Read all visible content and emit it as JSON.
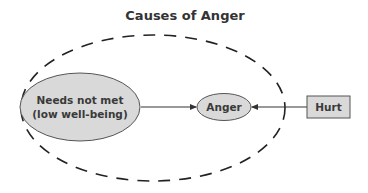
{
  "title": "Causes of Anger",
  "nodes": {
    "needs": {
      "line1": "Needs not met",
      "line2": "(low well-being)"
    },
    "anger": {
      "label": "Anger"
    },
    "hurt": {
      "label": "Hurt"
    }
  },
  "edges": [
    {
      "from": "Needs not met (low well-being)",
      "to": "Anger"
    },
    {
      "from": "Hurt",
      "to": "Anger"
    }
  ],
  "colors": {
    "node_fill": "#d9d9d9",
    "stroke": "#555555",
    "dashed_boundary": "#222222",
    "text": "#333333"
  }
}
